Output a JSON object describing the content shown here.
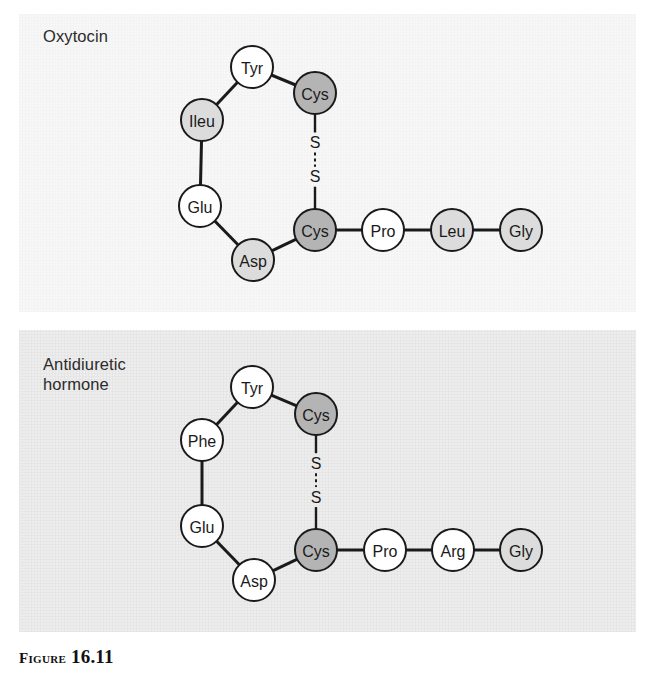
{
  "figure": {
    "caption_prefix": "Figure",
    "caption_number": "16.11"
  },
  "panels": [
    {
      "id": "oxytocin",
      "label": "Oxytocin",
      "background_color": "#f7f7f7",
      "disulfide": {
        "upper_sulfur": "S",
        "lower_sulfur": "S"
      },
      "nodes": [
        {
          "label": "Tyr",
          "shade": "white",
          "x": 252,
          "y": 67
        },
        {
          "label": "Cys",
          "shade": "dark",
          "x": 315,
          "y": 93
        },
        {
          "label": "Ileu",
          "shade": "light",
          "x": 202,
          "y": 120
        },
        {
          "label": "Glu",
          "shade": "white",
          "x": 200,
          "y": 206
        },
        {
          "label": "Asp",
          "shade": "light",
          "x": 253,
          "y": 260
        },
        {
          "label": "Cys",
          "shade": "dark",
          "x": 315,
          "y": 230
        },
        {
          "label": "Pro",
          "shade": "white",
          "x": 383,
          "y": 230
        },
        {
          "label": "Leu",
          "shade": "light",
          "x": 452,
          "y": 230
        },
        {
          "label": "Gly",
          "shade": "light",
          "x": 521,
          "y": 230
        }
      ],
      "bonds": [
        [
          0,
          1
        ],
        [
          0,
          2
        ],
        [
          2,
          3
        ],
        [
          3,
          4
        ],
        [
          4,
          5
        ],
        [
          5,
          6
        ],
        [
          6,
          7
        ],
        [
          7,
          8
        ]
      ]
    },
    {
      "id": "antidiuretic-hormone",
      "label": "Antidiuretic\nhormone",
      "background_color": "#ededed",
      "disulfide": {
        "upper_sulfur": "S",
        "lower_sulfur": "S"
      },
      "nodes": [
        {
          "label": "Tyr",
          "shade": "white",
          "x": 252,
          "y": 387
        },
        {
          "label": "Cys",
          "shade": "dark",
          "x": 316,
          "y": 414
        },
        {
          "label": "Phe",
          "shade": "white",
          "x": 202,
          "y": 440
        },
        {
          "label": "Glu",
          "shade": "white",
          "x": 202,
          "y": 526
        },
        {
          "label": "Asp",
          "shade": "white",
          "x": 254,
          "y": 580
        },
        {
          "label": "Cys",
          "shade": "dark",
          "x": 316,
          "y": 550
        },
        {
          "label": "Pro",
          "shade": "white",
          "x": 385,
          "y": 550
        },
        {
          "label": "Arg",
          "shade": "white",
          "x": 453,
          "y": 550
        },
        {
          "label": "Gly",
          "shade": "light",
          "x": 521,
          "y": 550
        }
      ],
      "bonds": [
        [
          0,
          1
        ],
        [
          0,
          2
        ],
        [
          2,
          3
        ],
        [
          3,
          4
        ],
        [
          4,
          5
        ],
        [
          5,
          6
        ],
        [
          6,
          7
        ],
        [
          7,
          8
        ]
      ]
    }
  ],
  "colors": {
    "node_white": "#ffffff",
    "node_light_gray": "#dcdcdc",
    "node_dark_gray": "#b4b4b4",
    "stroke": "#1a1a1a",
    "text": "#1a1a1a"
  },
  "geometry": {
    "node_radius": 21
  }
}
